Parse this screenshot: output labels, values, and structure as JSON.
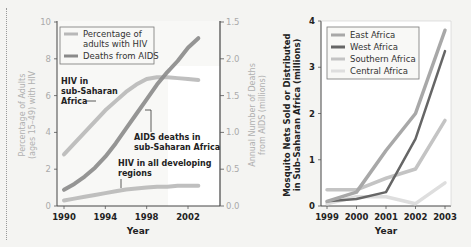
{
  "chart_data": [
    {
      "type": "line",
      "title": "",
      "xlabel": "Year",
      "ylabel": "Percentage of Adults (ages 15–49) with HIV",
      "ylabel2": "Annual Number of Deaths from AIDS (millions)",
      "xlim": [
        1990,
        2004
      ],
      "ylim": [
        0,
        10
      ],
      "ylim2": [
        0,
        2.5
      ],
      "xticks": [
        "1990",
        "1994",
        "1998",
        "2002"
      ],
      "xtick_values": [
        1990,
        1994,
        1998,
        2002
      ],
      "yticks": [
        "0",
        "2",
        "4",
        "6",
        "8",
        "10"
      ],
      "ytick_values": [
        0,
        2,
        4,
        6,
        8,
        10
      ],
      "yticks2": [
        "0.0",
        "0.5",
        "1.0",
        "1.5",
        "2.0",
        "1.5"
      ],
      "ytick2_values": [
        0,
        0.5,
        1.0,
        1.5,
        2.0,
        2.5
      ],
      "legend": {
        "position": "top-left",
        "entries": [
          {
            "label": "Percentage of adults with HIV",
            "color": "#b8b8b8"
          },
          {
            "label": "Deaths from AIDS",
            "color": "#8a8a8a"
          }
        ]
      },
      "series": [
        {
          "name": "HIV in sub-Saharan Africa",
          "axis": "left",
          "kind": "percentage",
          "color": "#b8b8b8",
          "x": [
            1990,
            1991,
            1992,
            1993,
            1994,
            1995,
            1996,
            1997,
            1998,
            1999,
            2000,
            2001,
            2002,
            2003
          ],
          "y": [
            2.8,
            3.4,
            4.0,
            4.6,
            5.2,
            5.7,
            6.2,
            6.6,
            6.9,
            7.0,
            7.0,
            6.95,
            6.9,
            6.85
          ]
        },
        {
          "name": "AIDS deaths in sub-Saharan Africa",
          "axis": "right",
          "kind": "deaths",
          "color": "#8a8a8a",
          "x": [
            1990,
            1991,
            1992,
            1993,
            1994,
            1995,
            1996,
            1997,
            1998,
            1999,
            2000,
            2001,
            2002,
            2003
          ],
          "y": [
            0.22,
            0.3,
            0.4,
            0.52,
            0.67,
            0.85,
            1.05,
            1.25,
            1.45,
            1.65,
            1.82,
            1.97,
            2.15,
            2.28
          ]
        },
        {
          "name": "HIV in all developing regions",
          "axis": "left",
          "kind": "percentage",
          "color": "#b8b8b8",
          "x": [
            1990,
            1991,
            1992,
            1993,
            1994,
            1995,
            1996,
            1997,
            1998,
            1999,
            2000,
            2001,
            2002,
            2003
          ],
          "y": [
            0.3,
            0.4,
            0.5,
            0.6,
            0.7,
            0.8,
            0.9,
            0.95,
            1.0,
            1.05,
            1.05,
            1.1,
            1.1,
            1.1
          ]
        }
      ],
      "annotations": [
        {
          "text_lines": [
            "HIV in",
            "sub-Saharan",
            "Africa"
          ]
        },
        {
          "text_lines": [
            "AIDS deaths in",
            "sub-Saharan Africa"
          ]
        },
        {
          "text_lines": [
            "HIV in all developing",
            "regions"
          ]
        }
      ]
    },
    {
      "type": "line",
      "title": "",
      "xlabel": "Year",
      "ylabel": "Mosquito Nets Sold or Distributed in Sub-Saharan Africa (millions)",
      "xlim": [
        1999,
        2003
      ],
      "ylim": [
        0,
        4
      ],
      "xticks": [
        "1999",
        "2000",
        "2001",
        "2002",
        "2003"
      ],
      "xtick_values": [
        1999,
        2000,
        2001,
        2002,
        2003
      ],
      "yticks": [
        "0",
        "1",
        "2",
        "3",
        "4"
      ],
      "ytick_values": [
        0,
        1,
        2,
        3,
        4
      ],
      "legend": {
        "position": "top-left",
        "entries": [
          {
            "label": "East Africa",
            "color": "#a8a8a8"
          },
          {
            "label": "West Africa",
            "color": "#666666"
          },
          {
            "label": "Southern Africa",
            "color": "#c4c4c4"
          },
          {
            "label": "Central Africa",
            "color": "#dedede"
          }
        ]
      },
      "series": [
        {
          "name": "East Africa",
          "color": "#a8a8a8",
          "x": [
            1999,
            2000,
            2001,
            2002,
            2003
          ],
          "y": [
            0.1,
            0.3,
            1.2,
            2.0,
            3.8
          ]
        },
        {
          "name": "West Africa",
          "color": "#666666",
          "x": [
            1999,
            2000,
            2001,
            2002,
            2003
          ],
          "y": [
            0.1,
            0.15,
            0.3,
            1.45,
            3.35
          ]
        },
        {
          "name": "Southern Africa",
          "color": "#c4c4c4",
          "x": [
            1999,
            2000,
            2001,
            2002,
            2003
          ],
          "y": [
            0.35,
            0.35,
            0.6,
            0.8,
            1.85
          ]
        },
        {
          "name": "Central Africa",
          "color": "#dedede",
          "x": [
            1999,
            2000,
            2001,
            2002,
            2003
          ],
          "y": [
            0.05,
            0.2,
            0.2,
            0.05,
            0.5
          ]
        }
      ]
    }
  ]
}
